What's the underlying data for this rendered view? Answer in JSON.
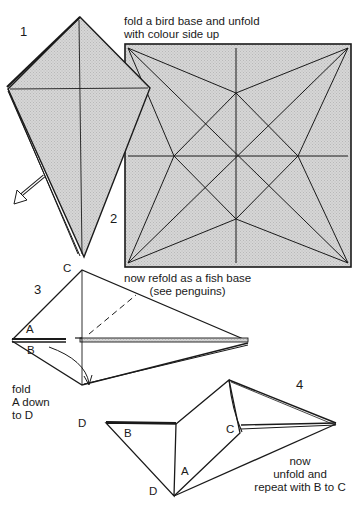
{
  "steps": [
    {
      "number": "1"
    },
    {
      "number": "2",
      "instruction_top_line1": "fold a bird base and unfold",
      "instruction_top_line2": "with colour side up",
      "instruction_bottom_line1": "now refold as a fish base",
      "instruction_bottom_line2": "(see penguins)"
    },
    {
      "number": "3",
      "instruction_line1": "fold",
      "instruction_line2": "A down",
      "instruction_line3": "to D"
    },
    {
      "number": "4",
      "instruction_line1": "now",
      "instruction_line2": "unfold and",
      "instruction_line3": "repeat with B to C"
    }
  ],
  "point_labels": {
    "c_step3": "C",
    "a_step3": "A",
    "b_step3": "B",
    "d_step3": "D",
    "b_step4": "B",
    "c_step4": "C",
    "a_step4": "A",
    "d_step4": "D"
  },
  "colors": {
    "paper_fill": "#cfcfcf",
    "line": "#1a1a1a",
    "background": "#ffffff"
  }
}
